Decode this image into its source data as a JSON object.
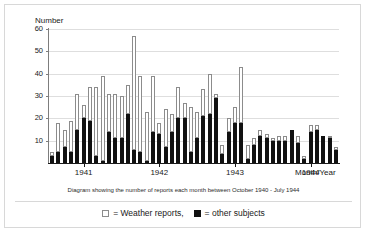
{
  "figure": {
    "caption": "Diagram showing the number of reports each month between October 1940 - July 1944",
    "y_axis_title": "Number",
    "x_axis_title": "Month/Year"
  },
  "legend": {
    "items": [
      {
        "swatch": "white",
        "label": "= Weather reports,"
      },
      {
        "swatch": "black",
        "label": "= other subjects"
      }
    ]
  },
  "chart_data": {
    "type": "bar",
    "stacked": true,
    "title": "",
    "subtitle": "",
    "caption": "Diagram showing the number of reports each month between October 1940 - July 1944",
    "xlabel": "Month/Year",
    "ylabel": "Number",
    "ylim": [
      0,
      60
    ],
    "yticks": [
      0,
      10,
      20,
      30,
      40,
      50,
      60
    ],
    "ytick_labels": [
      "0",
      "10",
      "20",
      "30",
      "40",
      "50",
      "60"
    ],
    "grid": true,
    "grid_axis": "y",
    "legend_position": "bottom-center",
    "xtick_labels": [
      "1941",
      "1942",
      "1943",
      "1944"
    ],
    "xtick_positions": [
      5,
      17,
      29,
      41
    ],
    "x_range_description": "October 1940 - July 1944, one bar per month",
    "categories": [
      "Oct 1940",
      "Nov 1940",
      "Dec 1940",
      "Jan 1941",
      "Feb 1941",
      "Mar 1941",
      "Apr 1941",
      "May 1941",
      "Jun 1941",
      "Jul 1941",
      "Aug 1941",
      "Sep 1941",
      "Oct 1941",
      "Nov 1941",
      "Dec 1941",
      "Jan 1942",
      "Feb 1942",
      "Mar 1942",
      "Apr 1942",
      "May 1942",
      "Jun 1942",
      "Jul 1942",
      "Aug 1942",
      "Sep 1942",
      "Oct 1942",
      "Nov 1942",
      "Dec 1942",
      "Jan 1943",
      "Feb 1943",
      "Mar 1943",
      "Apr 1943",
      "May 1943",
      "Jun 1943",
      "Jul 1943",
      "Aug 1943",
      "Sep 1943",
      "Oct 1943",
      "Nov 1943",
      "Dec 1943",
      "Jan 1944",
      "Feb 1944",
      "Mar 1944",
      "Apr 1944",
      "May 1944",
      "Jun 1944",
      "Jul 1944"
    ],
    "series": [
      {
        "name": "other subjects",
        "color": "#111111",
        "values": [
          3,
          5,
          7,
          5,
          15,
          20,
          19,
          3,
          1,
          14,
          11,
          11,
          22,
          6,
          5,
          1,
          14,
          13,
          7,
          14,
          20,
          20,
          5,
          11,
          21,
          22,
          29,
          4,
          14,
          18,
          18,
          2,
          8,
          12,
          11,
          10,
          10,
          10,
          15,
          9,
          2,
          14,
          15,
          12,
          11,
          6
        ]
      },
      {
        "name": "Weather reports",
        "color": "#ffffff",
        "values": [
          2,
          13,
          8,
          14,
          16,
          6,
          15,
          31,
          38,
          17,
          20,
          19,
          13,
          51,
          34,
          22,
          25,
          5,
          17,
          8,
          14,
          7,
          20,
          12,
          12,
          18,
          2,
          4,
          6,
          7,
          25,
          6,
          3,
          3,
          2,
          1,
          2,
          2,
          0,
          3,
          1,
          3,
          2,
          0,
          1,
          1
        ]
      }
    ],
    "totals": [
      5,
      18,
      15,
      19,
      31,
      26,
      34,
      34,
      39,
      31,
      31,
      30,
      35,
      57,
      39,
      23,
      39,
      18,
      24,
      22,
      34,
      27,
      25,
      23,
      33,
      40,
      31,
      8,
      20,
      25,
      43,
      8,
      11,
      15,
      13,
      11,
      12,
      12,
      15,
      12,
      3,
      17,
      17,
      12,
      12,
      7
    ]
  }
}
